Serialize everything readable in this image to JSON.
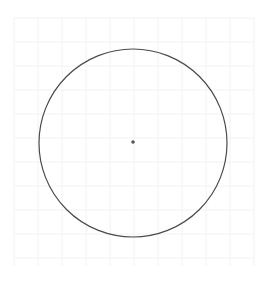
{
  "canvas": {
    "width": 267,
    "height": 283,
    "background": "#ffffff"
  },
  "grid": {
    "x0": 14,
    "y0": 18,
    "x1": 254,
    "y1": 266,
    "spacing": 24,
    "color": "#f2f2f2"
  },
  "circle": {
    "cx": 133,
    "cy": 143,
    "r": 94,
    "stroke": "#4a4a4a",
    "stroke_width": 1.2
  },
  "center_point": {
    "cx": 133,
    "cy": 142,
    "r": 1.8,
    "fill": "#555555"
  }
}
